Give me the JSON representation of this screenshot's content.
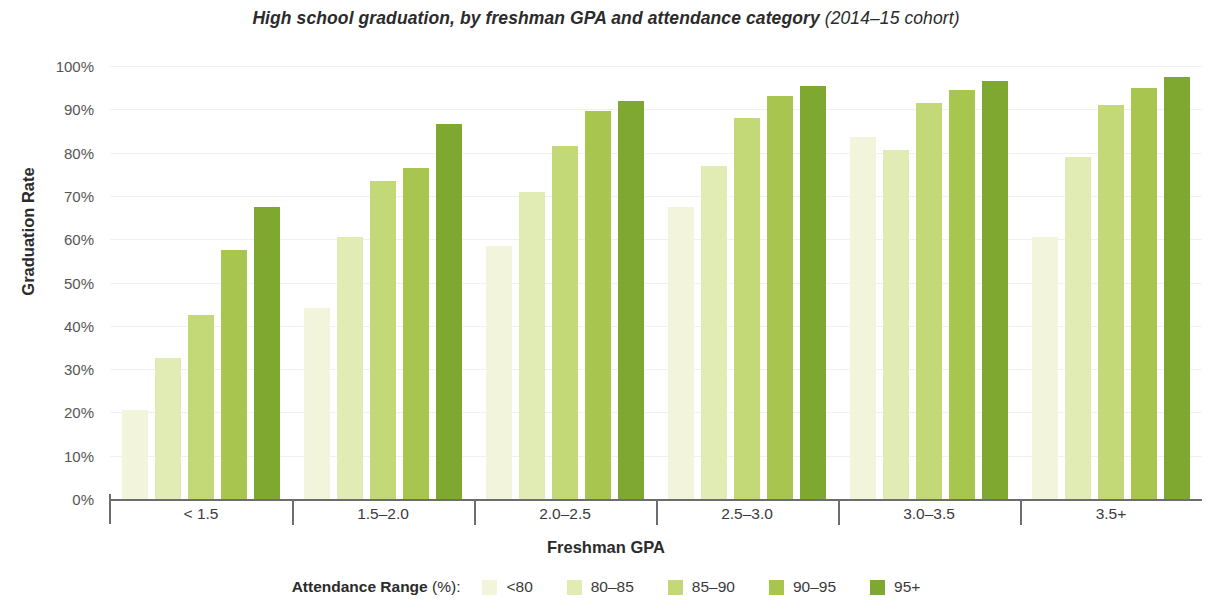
{
  "chart_data": {
    "type": "bar",
    "title": "High school graduation, by freshman GPA and attendance category",
    "subtitle": "(2014–15 cohort)",
    "xlabel": "Freshman GPA",
    "ylabel": "Graduation Rate",
    "ylim": [
      0,
      100
    ],
    "grid": true,
    "legend_position": "bottom",
    "legend_title": "Attendance Range",
    "legend_title_paren": "(%):",
    "categories": [
      "< 1.5",
      "1.5–2.0",
      "2.0–2.5",
      "2.5–3.0",
      "3.0–3.5",
      "3.5+"
    ],
    "ytick_labels": [
      "100%",
      "90%",
      "80%",
      "70%",
      "60%",
      "50%",
      "40%",
      "30%",
      "20%",
      "10%",
      "0%"
    ],
    "ytick_values": [
      100,
      90,
      80,
      70,
      60,
      50,
      40,
      30,
      20,
      10,
      0
    ],
    "series": [
      {
        "name": "<80",
        "color": "#f2f5dc",
        "values": [
          20.5,
          44.0,
          58.5,
          67.5,
          83.5,
          60.5
        ]
      },
      {
        "name": "80–85",
        "color": "#e1ecb4",
        "values": [
          32.5,
          60.5,
          71.0,
          77.0,
          80.5,
          79.0
        ]
      },
      {
        "name": "85–90",
        "color": "#c3d977",
        "values": [
          42.5,
          73.5,
          81.5,
          88.0,
          91.5,
          91.0
        ]
      },
      {
        "name": "90–95",
        "color": "#a8c64f",
        "values": [
          57.5,
          76.5,
          89.5,
          93.0,
          94.5,
          95.0
        ]
      },
      {
        "name": "95+",
        "color": "#7fa830",
        "values": [
          67.5,
          86.5,
          92.0,
          95.5,
          96.5,
          97.5
        ]
      }
    ]
  }
}
